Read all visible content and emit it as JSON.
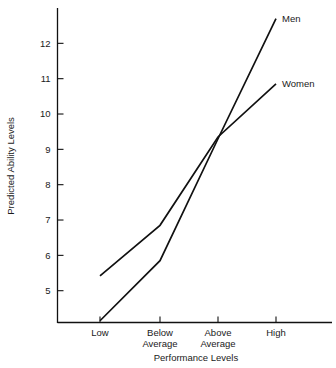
{
  "chart_data": {
    "type": "line",
    "title": "",
    "xlabel": "Performance Levels",
    "ylabel": "Predicted Ability Levels",
    "categories": [
      "Low",
      "Below Average",
      "Above Average",
      "High"
    ],
    "category_lines": [
      [
        "Low"
      ],
      [
        "Below",
        "Average"
      ],
      [
        "Above",
        "Average"
      ],
      [
        "High"
      ]
    ],
    "yticks": [
      5,
      6,
      7,
      8,
      9,
      10,
      11,
      12
    ],
    "ytick_labels": [
      "5",
      "6",
      "7",
      "8",
      "9",
      "10",
      "11",
      "12"
    ],
    "ylim": [
      4.1,
      13.0
    ],
    "grid": false,
    "legend_position": "inline-right-of-line-ends",
    "series": [
      {
        "name": "Men",
        "label": "Men",
        "values": [
          4.15,
          5.85,
          9.3,
          12.7
        ],
        "color": "#111111"
      },
      {
        "name": "Women",
        "label": "Women",
        "values": [
          5.42,
          6.85,
          9.35,
          10.85
        ],
        "color": "#111111"
      }
    ],
    "annotations": [
      {
        "text": "Men",
        "at_category": "High"
      },
      {
        "text": "Women",
        "at_category": "High"
      }
    ]
  },
  "axes": {
    "y_axis_title": "Predicted Ability Levels",
    "x_axis_title": "Performance Levels"
  },
  "colors": {
    "background": "#ffffff",
    "ink": "#111111",
    "text": "#1a1a1a"
  }
}
